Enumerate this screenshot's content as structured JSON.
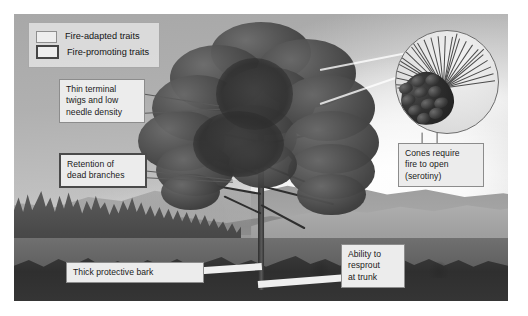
{
  "figure": {
    "photo_description": "Black-and-white photograph of a mature pine tree standing in open grassland with a conifer forest and mountain ridge in the background"
  },
  "legend": {
    "items": [
      {
        "label": "Fire-adapted traits",
        "style": "thin-border",
        "swatch_name": "legend-swatch-fire-adapted"
      },
      {
        "label": "Fire-promoting traits",
        "style": "thick-border",
        "swatch_name": "legend-swatch-fire-promoting"
      }
    ]
  },
  "callouts": [
    {
      "id": "thin-terminal-twigs",
      "text": "Thin terminal\ntwigs and low\nneedle density",
      "trait_type": "fire-adapted",
      "points_to": "upper crown foliage"
    },
    {
      "id": "retention-dead-branches",
      "text": "Retention of\ndead branches",
      "trait_type": "fire-promoting",
      "points_to": "lower dead branches on trunk"
    },
    {
      "id": "cones-serotiny",
      "text": "Cones require\nfire to open\n(serotiny)",
      "trait_type": "fire-adapted",
      "points_to": "magnified pine cone inset"
    },
    {
      "id": "thick-protective-bark",
      "text": "Thick protective bark",
      "trait_type": "fire-adapted",
      "points_to": "trunk bark"
    },
    {
      "id": "resprout-at-trunk",
      "text": "Ability to\nresprout\nat trunk",
      "trait_type": "fire-adapted",
      "points_to": "base of trunk"
    }
  ],
  "inset": {
    "name": "pine-cone-magnifier",
    "description": "Circular magnified view of a closed serotinous pine cone surrounded by a fan of long pine needles"
  },
  "colors": {
    "label_fill": "#ececec",
    "label_border_adapted": "#8c8c8c",
    "label_border_promoting": "#4a4a4a",
    "leader_line": "#f0f0f0",
    "plate_background": "#ffffff"
  }
}
